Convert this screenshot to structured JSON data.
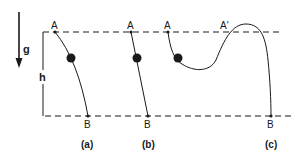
{
  "figure": {
    "gravity": {
      "symbol": "g",
      "direction": "down"
    },
    "height": {
      "symbol": "h"
    },
    "reference_lines": {
      "top": "dashed",
      "bottom": "dashed"
    },
    "panels": [
      {
        "id": "a",
        "caption": "(a)",
        "start_label": "A",
        "end_label": "B",
        "path": "curved"
      },
      {
        "id": "b",
        "caption": "(b)",
        "start_label": "A",
        "end_label": "B",
        "path": "straight"
      },
      {
        "id": "c",
        "caption": "(c)",
        "start_label": "A",
        "peak_label": "A'",
        "end_label": "B",
        "path": "dip-and-hump"
      }
    ]
  },
  "colors": {
    "ink": "#1a1a1a",
    "background": "#ffffff"
  }
}
